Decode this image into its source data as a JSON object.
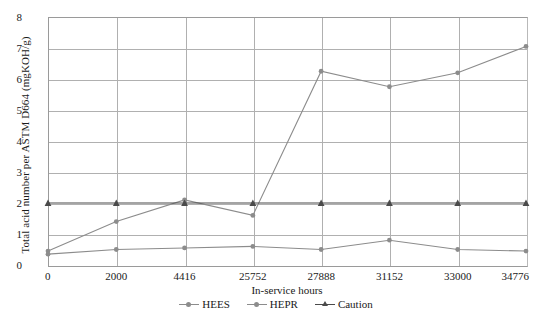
{
  "chart_data": {
    "type": "line",
    "title": "",
    "xlabel": "In-service hours",
    "ylabel": "Total acid number per ASTM D664 (mgKOH/g)",
    "categories": [
      "0",
      "2000",
      "4416",
      "25752",
      "27888",
      "31152",
      "33000",
      "34776"
    ],
    "ylim": [
      0,
      8
    ],
    "yticks": [
      "0",
      "1",
      "2",
      "3",
      "4",
      "5",
      "6",
      "7",
      "8"
    ],
    "grid": true,
    "legend_position": "bottom",
    "series": [
      {
        "name": "HEES",
        "color": "#8c8c8c",
        "marker": "circle",
        "values": [
          0.45,
          1.4,
          2.1,
          1.6,
          6.25,
          5.75,
          6.2,
          7.05
        ]
      },
      {
        "name": "HEPR",
        "color": "#8c8c8c",
        "marker": "circle",
        "values": [
          0.35,
          0.5,
          0.55,
          0.6,
          0.5,
          0.8,
          0.5,
          0.45
        ]
      },
      {
        "name": "Caution",
        "color": "#4a4a4a",
        "marker": "triangle",
        "values": [
          2.0,
          2.0,
          2.0,
          2.0,
          2.0,
          2.0,
          2.0,
          2.0
        ]
      }
    ]
  },
  "legend": {
    "items": [
      {
        "label": "HEES"
      },
      {
        "label": "HEPR"
      },
      {
        "label": "Caution"
      }
    ]
  }
}
